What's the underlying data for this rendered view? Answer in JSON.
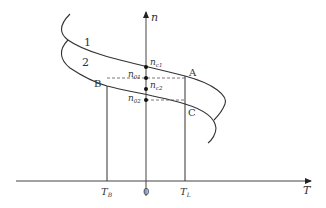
{
  "diagram": {
    "type": "characteristic curves",
    "axes": {
      "x": {
        "label": "T",
        "ticks": [
          {
            "label": "T",
            "sub": "B",
            "x": 107
          },
          {
            "label": "0",
            "sub": "",
            "x": 146
          },
          {
            "label": "T",
            "sub": "L",
            "x": 185
          }
        ]
      },
      "y": {
        "label": "n"
      }
    },
    "curves": [
      {
        "label": "1"
      },
      {
        "label": "2"
      }
    ],
    "points": {
      "A": "A",
      "B": "B",
      "C": "C"
    },
    "axis_marks": [
      {
        "label": "n",
        "sub": "c1"
      },
      {
        "label": "n",
        "sub": "01"
      },
      {
        "label": "n",
        "sub": "c2"
      },
      {
        "label": "n",
        "sub": "02"
      }
    ],
    "colors": {
      "line": "#333333",
      "dashed": "#555555"
    }
  }
}
